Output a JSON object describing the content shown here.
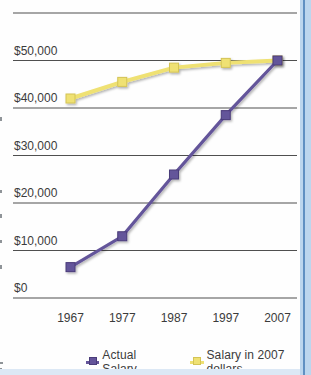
{
  "chart_data": {
    "type": "line",
    "title": "",
    "categories": [
      "1967",
      "1977",
      "1987",
      "1997",
      "2007"
    ],
    "series": [
      {
        "name": "Actual Salary",
        "values": [
          6500,
          13000,
          26000,
          38500,
          50000
        ],
        "color": "#64549a",
        "edge": "#4a3c7a",
        "marker": "square"
      },
      {
        "name": "Salary in 2007 dollars",
        "values": [
          42000,
          45500,
          48500,
          49500,
          50000
        ],
        "color": "#efe173",
        "edge": "#d4c455",
        "marker": "square"
      }
    ],
    "xlabel": "",
    "ylabel": "",
    "ylim": [
      0,
      60000
    ],
    "ytick_values": [
      0,
      10000,
      20000,
      30000,
      40000,
      50000
    ],
    "ytick_labels": [
      "$0",
      "$10,000",
      "$20,000",
      "$30,000",
      "$40,000",
      "$50,000"
    ],
    "grid": "horizontal",
    "gridline_color": "#4f4f4f",
    "tick_label_color": "#3b3b3b",
    "legend_position": "bottom"
  },
  "page": {
    "background": "#fefefe",
    "border_right_color": "#bcd6ee",
    "border_right_line_color": "#6090c2",
    "border_bottom_color": "#dce8f5"
  }
}
